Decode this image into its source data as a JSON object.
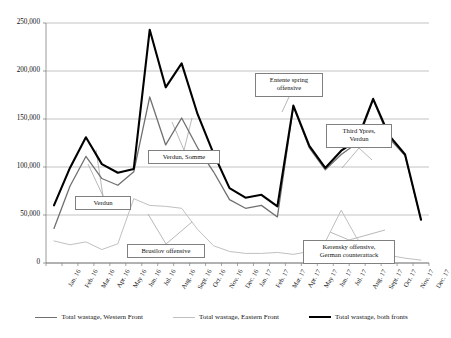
{
  "chart_data": {
    "type": "line",
    "title": "",
    "xlabel": "",
    "ylabel": "",
    "ylim": [
      0,
      250000
    ],
    "ytick_values": [
      0,
      50000,
      100000,
      150000,
      200000,
      250000
    ],
    "ytick_labels": [
      "0",
      "50,000",
      "100,000",
      "150,000",
      "200,000",
      "250,000"
    ],
    "grid": true,
    "legend_position": "bottom",
    "categories": [
      "Jan. 16",
      "Feb. 16",
      "Mar. 16",
      "Apr. 16",
      "May 16",
      "Jun. 16",
      "Jul. 16",
      "Aug. 16",
      "Sept. 16",
      "Oct. 16",
      "Nov. 16",
      "Dec. 16",
      "Jan. 17",
      "Feb. 17",
      "Mar. 17",
      "Apr. 17",
      "May 17",
      "Jun. 17",
      "Jul. 17",
      "Aug. 17",
      "Sept. 17",
      "Oct. 17",
      "Nov. 17",
      "Dec. 17"
    ],
    "series": [
      {
        "name": "Total wastage, Western Front",
        "color": "#707070",
        "width": 1.3,
        "values": [
          36000,
          80000,
          111000,
          88000,
          81000,
          95000,
          173000,
          123000,
          151000,
          120000,
          95000,
          66000,
          57000,
          60000,
          48000,
          163000,
          120000,
          97000,
          113000,
          125000,
          170000,
          130000,
          112000,
          45000
        ]
      },
      {
        "name": "Total wastage, Eastern Front",
        "color": "#c0c0c0",
        "width": 1.0,
        "values": [
          23000,
          19000,
          22000,
          14000,
          20000,
          67000,
          60000,
          59000,
          57000,
          35000,
          18000,
          12000,
          10000,
          10000,
          11000,
          9000,
          12000,
          22000,
          55000,
          25000,
          12000,
          8000,
          5000,
          3000
        ]
      },
      {
        "name": "Total wastage, both fronts",
        "color": "#000000",
        "width": 2.1,
        "values": [
          60000,
          99000,
          131000,
          103000,
          94000,
          98000,
          243000,
          183000,
          208000,
          155000,
          114000,
          78000,
          68000,
          71000,
          59000,
          164000,
          122000,
          99000,
          117000,
          128000,
          171000,
          133000,
          113000,
          45000
        ]
      }
    ],
    "annotations": [
      {
        "id": "verdun",
        "text": "Verdun",
        "lines": [
          "Verdun"
        ],
        "x": 75,
        "y": 196,
        "w": 56,
        "h": 13
      },
      {
        "id": "verdun-somme",
        "text": "Verdun, Somme",
        "lines": [
          "Verdun, Somme"
        ],
        "x": 148,
        "y": 150,
        "w": 72,
        "h": 13
      },
      {
        "id": "brusilov",
        "text": "Brusilov offensive",
        "lines": [
          "Brusilov offensive"
        ],
        "x": 127,
        "y": 244,
        "w": 78,
        "h": 13
      },
      {
        "id": "entente-spring",
        "text": "Entente spring offensive",
        "lines": [
          "Entente spring",
          "offensive"
        ],
        "x": 255,
        "y": 73,
        "w": 68,
        "h": 24
      },
      {
        "id": "third-ypres",
        "text": "Third Ypres, Verdun",
        "lines": [
          "Third Ypres,",
          "Verdun"
        ],
        "x": 326,
        "y": 124,
        "w": 66,
        "h": 24
      },
      {
        "id": "kerensky",
        "text": "Kerensky offensive, German counterattack",
        "lines": [
          "Kerensky offensive,",
          "German counterattack"
        ],
        "x": 303,
        "y": 240,
        "w": 92,
        "h": 24
      }
    ],
    "leader_lines": [
      {
        "from": [
          103,
          196
        ],
        "to": [
          88,
          164
        ]
      },
      {
        "from": [
          103,
          196
        ],
        "to": [
          96,
          150
        ]
      },
      {
        "from": [
          184,
          150
        ],
        "to": [
          172,
          122
        ]
      },
      {
        "from": [
          184,
          150
        ],
        "to": [
          192,
          118
        ]
      },
      {
        "from": [
          166,
          244
        ],
        "to": [
          148,
          214
        ]
      },
      {
        "from": [
          166,
          244
        ],
        "to": [
          192,
          222
        ]
      },
      {
        "from": [
          289,
          97
        ],
        "to": [
          282,
          112
        ]
      },
      {
        "from": [
          359,
          148
        ],
        "to": [
          342,
          168
        ]
      },
      {
        "from": [
          359,
          148
        ],
        "to": [
          372,
          160
        ]
      },
      {
        "from": [
          349,
          240
        ],
        "to": [
          330,
          232
        ]
      },
      {
        "from": [
          349,
          240
        ],
        "to": [
          385,
          230
        ]
      }
    ]
  },
  "legend": {
    "items": [
      {
        "label": "Total wastage, Western Front",
        "color": "#707070",
        "width": 1.3
      },
      {
        "label": "Total wastage, Eastern Front",
        "color": "#c0c0c0",
        "width": 1.0
      },
      {
        "label": "Total wastage, both fronts",
        "color": "#000000",
        "width": 2.4
      }
    ]
  },
  "axes": {
    "plot_left": 46,
    "plot_right": 429,
    "plot_top": 23,
    "plot_bottom": 263,
    "axis_color": "#808080",
    "grid_color": "#a9a9a9"
  }
}
